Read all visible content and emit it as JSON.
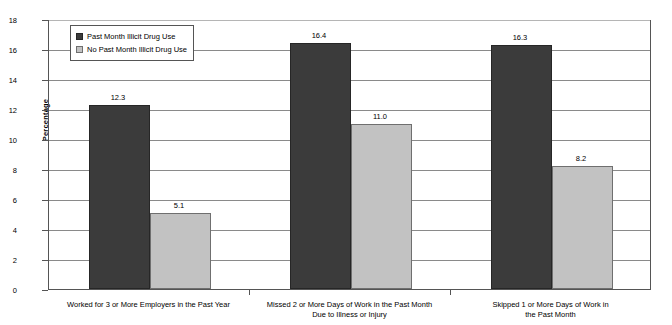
{
  "chart_data": {
    "type": "bar",
    "title": "",
    "subtitle": "",
    "xlabel": "",
    "ylabel": "Percentage",
    "ylim": [
      0,
      18
    ],
    "ytick_step": 2,
    "yticks": [
      "18",
      "16",
      "14",
      "12",
      "10",
      "8",
      "6",
      "4",
      "2",
      "0"
    ],
    "grid": "horizontal",
    "legend_position": "top-left-inside",
    "categories": [
      "Worked for 3 or More Employers in the Past Year",
      "Missed 2 or More Days of Work in the Past Month\nDue to Illness or Injury",
      "Skipped 1 or More Days of Work in the Past Month"
    ],
    "series": [
      {
        "name": "Past Month Illicit Drug Use",
        "color": "#3b3b3b",
        "values": [
          12.3,
          16.4,
          16.3
        ],
        "labels": [
          "12.3",
          "16.4",
          "16.3"
        ]
      },
      {
        "name": "No Past Month Illicit Drug Use",
        "color": "#c2c2c2",
        "values": [
          5.1,
          11.0,
          8.2
        ],
        "labels": [
          "5.1",
          "11.0",
          "8.2"
        ]
      }
    ]
  },
  "legend": {
    "items": [
      {
        "label": "Past Month Illicit Drug Use",
        "swatch": "dark"
      },
      {
        "label": "No Past Month Illicit Drug Use",
        "swatch": "light"
      }
    ]
  }
}
